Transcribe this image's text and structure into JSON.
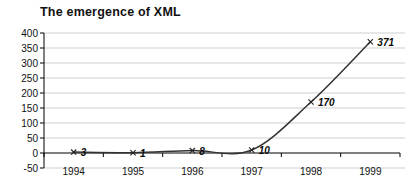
{
  "chart_data": {
    "type": "line",
    "title": "The emergence of XML",
    "categories": [
      "1994",
      "1995",
      "1996",
      "1997",
      "1998",
      "1999"
    ],
    "values": [
      3,
      1,
      8,
      10,
      170,
      371
    ],
    "data_labels": [
      "3",
      "1",
      "8",
      "10",
      "170",
      "371"
    ],
    "xlabel": "",
    "ylabel": "",
    "ylim": [
      -50,
      400
    ],
    "ytick_step": 50,
    "yticks": [
      400,
      350,
      300,
      250,
      200,
      150,
      100,
      50,
      0,
      -50
    ],
    "grid_values": [
      400,
      350,
      300,
      250,
      200,
      150,
      100,
      50,
      -50
    ],
    "grid": "horizontal",
    "legend": "none",
    "line_style": "smoothed",
    "marker": "x",
    "colors": {
      "line": "#333333",
      "marker": "#222222",
      "grid": "#cfcfcf",
      "axis": "#000000",
      "tick_text": "#111111",
      "label_text": "#0a0a0a"
    }
  }
}
